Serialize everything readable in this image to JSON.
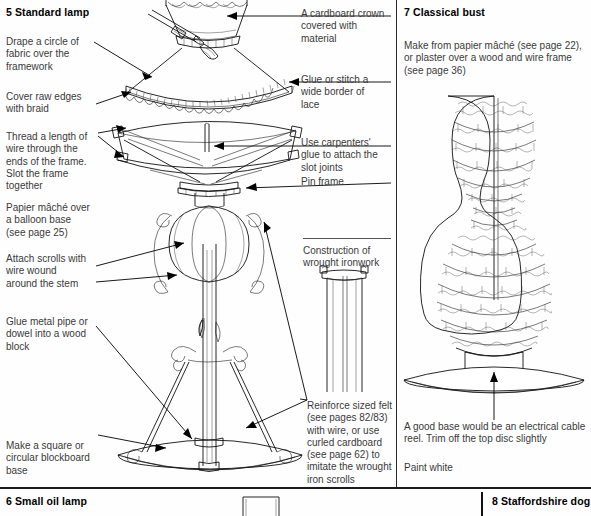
{
  "page": {
    "width": 591,
    "height": 516,
    "background": "#ffffff",
    "ink": "#1a1a1a"
  },
  "sections": {
    "panel_5": {
      "heading": "5 Standard lamp",
      "captions": [
        {
          "id": "drape",
          "text": "Drape a circle of\nfabric over the\nframework"
        },
        {
          "id": "cover_raw_edges",
          "text": "Cover raw edges\nwith braid"
        },
        {
          "id": "thread_wire",
          "text": "Thread a length of\nwire through the\nends of the frame.\nSlot the frame\ntogether"
        },
        {
          "id": "papier_mache_balloon",
          "text": "Papier mâché over\na balloon base\n(see page 25)"
        },
        {
          "id": "attach_scrolls",
          "text": "Attach scrolls with\nwire wound\naround the stem"
        },
        {
          "id": "glue_metal_pipe",
          "text": "Glue metal pipe or\ndowel into a wood\nblock"
        },
        {
          "id": "blockboard_base",
          "text": "Make a square or\ncircular blockboard\nbase"
        },
        {
          "id": "cardboard_crown",
          "text": "A cardboard crown\ncovered with\nmaterial"
        },
        {
          "id": "glue_or_stitch",
          "text": "Glue or stitch a\nwide border of\nlace"
        },
        {
          "id": "carpenters_glue",
          "text": "Use carpenters'\nglue to attach the\nslot joints"
        },
        {
          "id": "pin_frame",
          "text": "Pin frame"
        },
        {
          "id": "construction_ironwork",
          "text": "Construction of\nwrought ironwork"
        },
        {
          "id": "reinforce_felt",
          "text": "Reinforce sized felt\n(see pages 82/83)\nwith wire, or use\ncurled cardboard\n(see page 62) to\nimitate the wrought\niron scrolls"
        }
      ]
    },
    "panel_7": {
      "heading": "7 Classical bust",
      "captions": [
        {
          "id": "make_from",
          "text": "Make from papier mâché (see page 22),\nor plaster over a wood and wire frame\n(see page 36)"
        },
        {
          "id": "good_base",
          "text": "A good base would be an electrical cable\nreel. Trim off the top disc slightly"
        },
        {
          "id": "paint_white",
          "text": "Paint white"
        }
      ]
    },
    "panel_6": {
      "heading": "6 Small oil lamp"
    },
    "panel_8": {
      "heading": "8 Staffordshire dog"
    }
  },
  "figures": [
    {
      "id": "lampshade-fabric-figure",
      "label": "draped fabric lampshade cover"
    },
    {
      "id": "lamp-frame-figure",
      "label": "slotted lampshade frame on stand"
    },
    {
      "id": "wrought-ironwork-figure",
      "label": "wrought ironwork column detail"
    },
    {
      "id": "classical-bust-figure",
      "label": "wire mesh classical bust on disc base"
    },
    {
      "id": "oil-lamp-figure",
      "label": "small oil lamp partial"
    }
  ]
}
